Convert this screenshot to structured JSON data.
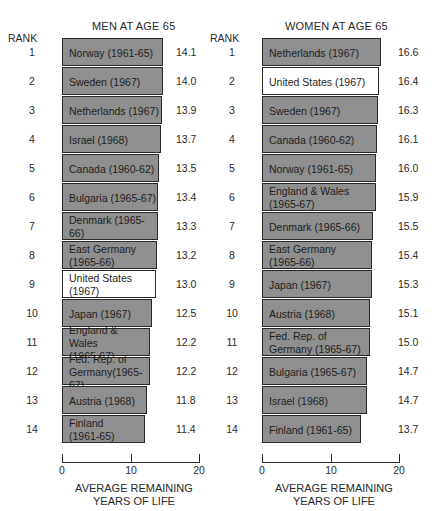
{
  "rank_header": "RANK",
  "chart_data": [
    {
      "type": "bar",
      "orientation": "horizontal",
      "title": "MEN AT AGE 65",
      "xlabel": "AVERAGE REMAINING YEARS OF LIFE",
      "ylabel": "RANK",
      "xlim": [
        0,
        20
      ],
      "xticks": [
        "0",
        "10",
        "20"
      ],
      "highlight": "United States",
      "rows": [
        {
          "rank": "1",
          "label": "Norway   (1961-65)",
          "value": 14.1,
          "value_text": "14.1",
          "highlight": false
        },
        {
          "rank": "2",
          "label": "Sweden   (1967)",
          "value": 14.0,
          "value_text": "14.0",
          "highlight": false
        },
        {
          "rank": "3",
          "label": "Netherlands  (1967)",
          "value": 13.9,
          "value_text": "13.9",
          "highlight": false
        },
        {
          "rank": "4",
          "label": "Israel   (1968)",
          "value": 13.7,
          "value_text": "13.7",
          "highlight": false
        },
        {
          "rank": "5",
          "label": "Canada  (1960-62)",
          "value": 13.5,
          "value_text": "13.5",
          "highlight": false
        },
        {
          "rank": "6",
          "label": "Bulgaria  (1965-67)",
          "value": 13.4,
          "value_text": "13.4",
          "highlight": false
        },
        {
          "rank": "7",
          "label": "Denmark (1965-66)",
          "value": 13.3,
          "value_text": "13.3",
          "highlight": false
        },
        {
          "rank": "8",
          "label": "East Germany\n(1965-66)",
          "value": 13.2,
          "value_text": "13.2",
          "highlight": false
        },
        {
          "rank": "9",
          "label": "United States\n(1967)",
          "value": 13.0,
          "value_text": "13.0",
          "highlight": true
        },
        {
          "rank": "10",
          "label": "Japan    (1967)",
          "value": 12.5,
          "value_text": "12.5",
          "highlight": false
        },
        {
          "rank": "11",
          "label": "England & Wales\n(1965-67)",
          "value": 12.2,
          "value_text": "12.2",
          "highlight": false
        },
        {
          "rank": "12",
          "label": "Fed. Rep. of\nGermany(1965-67)",
          "value": 12.2,
          "value_text": "12.2",
          "highlight": false
        },
        {
          "rank": "13",
          "label": "Austria   (1968)",
          "value": 11.8,
          "value_text": "11.8",
          "highlight": false
        },
        {
          "rank": "14",
          "label": "Finland\n(1961-65)",
          "value": 11.4,
          "value_text": "11.4",
          "highlight": false
        }
      ]
    },
    {
      "type": "bar",
      "orientation": "horizontal",
      "title": "WOMEN AT AGE 65",
      "xlabel": "AVERAGE REMAINING YEARS OF LIFE",
      "ylabel": "RANK",
      "xlim": [
        0,
        20
      ],
      "xticks": [
        "0",
        "10",
        "20"
      ],
      "highlight": "United States",
      "rows": [
        {
          "rank": "1",
          "label": "Netherlands   (1967)",
          "value": 16.6,
          "value_text": "16.6",
          "highlight": false
        },
        {
          "rank": "2",
          "label": "United States   (1967)",
          "value": 16.4,
          "value_text": "16.4",
          "highlight": true
        },
        {
          "rank": "3",
          "label": "Sweden   (1967)",
          "value": 16.3,
          "value_text": "16.3",
          "highlight": false
        },
        {
          "rank": "4",
          "label": "Canada    (1960-62)",
          "value": 16.1,
          "value_text": "16.1",
          "highlight": false
        },
        {
          "rank": "5",
          "label": "Norway    (1961-65)",
          "value": 16.0,
          "value_text": "16.0",
          "highlight": false
        },
        {
          "rank": "6",
          "label": "England & Wales\n(1965-67)",
          "value": 15.9,
          "value_text": "15.9",
          "highlight": false
        },
        {
          "rank": "7",
          "label": "Denmark    (1965-66)",
          "value": 15.5,
          "value_text": "15.5",
          "highlight": false
        },
        {
          "rank": "8",
          "label": "East Germany\n(1965-66)",
          "value": 15.4,
          "value_text": "15.4",
          "highlight": false
        },
        {
          "rank": "9",
          "label": "Japan    (1967)",
          "value": 15.3,
          "value_text": "15.3",
          "highlight": false
        },
        {
          "rank": "10",
          "label": "Austria     (1968)",
          "value": 15.1,
          "value_text": "15.1",
          "highlight": false
        },
        {
          "rank": "11",
          "label": "Fed. Rep. of\nGermany   (1965-67)",
          "value": 15.0,
          "value_text": "15.0",
          "highlight": false
        },
        {
          "rank": "12",
          "label": "Bulgaria    (1965-67)",
          "value": 14.7,
          "value_text": "14.7",
          "highlight": false
        },
        {
          "rank": "13",
          "label": "Israel    (1968)",
          "value": 14.7,
          "value_text": "14.7",
          "highlight": false
        },
        {
          "rank": "14",
          "label": "Finland   (1961-65)",
          "value": 13.7,
          "value_text": "13.7",
          "highlight": false
        }
      ]
    }
  ],
  "axis_title_line1": "AVERAGE REMAINING",
  "axis_title_line2": "YEARS OF LIFE",
  "colors": {
    "bar": "#8f8f8f",
    "highlight_bar": "#ffffff",
    "outline": "#2a2a2a"
  }
}
